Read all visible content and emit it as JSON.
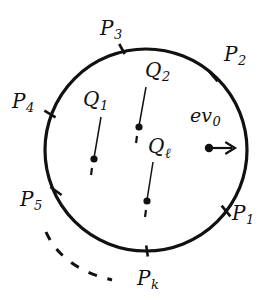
{
  "figure": {
    "type": "geometric-diagram",
    "stroke_color": "#111111",
    "background_color": "#ffffff",
    "circle": {
      "center_x": 146,
      "center_y": 150,
      "radius": 101,
      "stroke_width": 3.2
    },
    "boundary_points": [
      {
        "id": "P1",
        "base": "P",
        "subscript": "1",
        "tick_x": 226,
        "tick_y": 211,
        "label_x": 232,
        "label_y": 203
      },
      {
        "id": "P2",
        "base": "P",
        "subscript": "2",
        "tick_x": 213,
        "tick_y": 76,
        "label_x": 224,
        "label_y": 44
      },
      {
        "id": "P3",
        "base": "P",
        "subscript": "3",
        "tick_x": 122,
        "tick_y": 49,
        "label_x": 100,
        "label_y": 18
      },
      {
        "id": "P4",
        "base": "P",
        "subscript": "4",
        "tick_x": 50,
        "tick_y": 114,
        "label_x": 12,
        "label_y": 91
      },
      {
        "id": "P5",
        "base": "P",
        "subscript": "5",
        "tick_x": 56,
        "tick_y": 191,
        "label_x": 20,
        "label_y": 189
      },
      {
        "id": "Pk",
        "base": "P",
        "subscript": "k",
        "tick_x": 147,
        "tick_y": 251,
        "label_x": 137,
        "label_y": 268
      }
    ],
    "interior_segments": [
      {
        "id": "Q1",
        "base": "Q",
        "subscript": "1",
        "label_x": 83,
        "label_y": 89,
        "line_x1": 101,
        "line_y1": 117,
        "line_x2": 94,
        "line_y2": 158,
        "dot_x": 94,
        "dot_y": 159,
        "dot_r": 3.6,
        "dash_x1": 92,
        "dash_y1": 168,
        "dash_x2": 91,
        "dash_y2": 175
      },
      {
        "id": "Q2",
        "base": "Q",
        "subscript": "2",
        "label_x": 145,
        "label_y": 60,
        "line_x1": 146,
        "line_y1": 87,
        "line_x2": 139,
        "line_y2": 126,
        "dot_x": 139,
        "dot_y": 127,
        "dot_r": 3.6,
        "dash_x1": 137,
        "dash_y1": 136,
        "dash_x2": 136,
        "dash_y2": 143
      },
      {
        "id": "Ql",
        "base": "Q",
        "subscript": "ℓ",
        "label_x": 148,
        "label_y": 136,
        "line_x1": 153,
        "line_y1": 162,
        "line_x2": 147,
        "line_y2": 200,
        "dot_x": 147,
        "dot_y": 201,
        "dot_r": 3.6,
        "dash_x1": 146,
        "dash_y1": 210,
        "dash_x2": 145,
        "dash_y2": 217
      }
    ],
    "vector": {
      "id": "ev0",
      "base": "ev",
      "subscript": "0",
      "label_x": 190,
      "label_y": 106,
      "dot_x": 209,
      "dot_y": 148,
      "dot_r": 4.2,
      "arrow_x1": 209,
      "arrow_y1": 148,
      "arrow_x2": 235,
      "arrow_y2": 148
    },
    "dashed_arc": {
      "description": "dashed arc outside circle at lower-left",
      "path": "M 46 232 Q 62 268 112 280",
      "dash_pattern": "9 11",
      "stroke_width": 3
    },
    "tick_length": 11,
    "tick_width": 2.6
  }
}
